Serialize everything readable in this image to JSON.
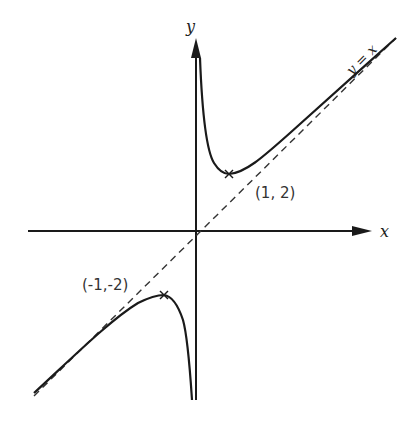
{
  "diagram": {
    "type": "function-graph",
    "function": "y = x + 1/x",
    "axes": {
      "x_label": "x",
      "y_label": "y"
    },
    "asymptote": {
      "label": "y = x",
      "style": "dashed"
    },
    "points": [
      {
        "label": "(1, 2)",
        "x": 1,
        "y": 2,
        "kind": "local minimum"
      },
      {
        "label": "(-1,-2)",
        "x": -1,
        "y": -2,
        "kind": "local maximum"
      }
    ],
    "colors": {
      "stroke": "#1a1a1a",
      "text": "#333333",
      "background": "#ffffff"
    }
  }
}
